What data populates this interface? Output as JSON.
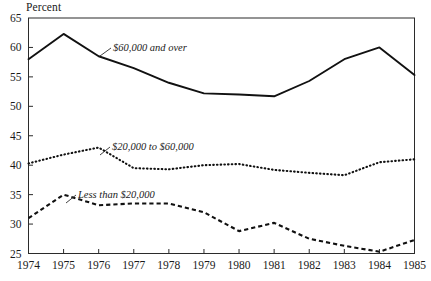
{
  "axis_unit_label": "Percent",
  "annotations": {
    "high": "$60,000 and over",
    "mid": "$20,000 to $60,000",
    "low": "Less than $20,000"
  },
  "colors": {
    "ink": "#111111",
    "frame": "#2b2b2b",
    "background": "#ffffff"
  },
  "chart_data": {
    "type": "line",
    "title": "",
    "subtitle": "",
    "xlabel": "",
    "ylabel": "Percent",
    "xlim": [
      1974,
      1985
    ],
    "ylim": [
      25,
      65
    ],
    "ytick_step": 5,
    "grid": false,
    "legend": "inline-annotations",
    "x": [
      1974,
      1975,
      1976,
      1977,
      1978,
      1979,
      1980,
      1981,
      1982,
      1983,
      1984,
      1985
    ],
    "xticklabels": [
      "1974",
      "1975",
      "1976",
      "1977",
      "1978",
      "1979",
      "1980",
      "1981",
      "1982",
      "1983",
      "1984",
      "1985"
    ],
    "yticklabels": [
      "25",
      "30",
      "35",
      "40",
      "45",
      "50",
      "55",
      "60",
      "65"
    ],
    "yticks": [
      25,
      30,
      35,
      40,
      45,
      50,
      55,
      60,
      65
    ],
    "series": [
      {
        "name": "$60,000 and over",
        "style": "solid",
        "values": [
          58.0,
          62.3,
          58.5,
          56.5,
          54.0,
          52.2,
          52.0,
          51.7,
          54.3,
          58.0,
          60.0,
          55.3
        ]
      },
      {
        "name": "$20,000 to $60,000",
        "style": "dotted",
        "values": [
          40.3,
          41.8,
          43.0,
          39.5,
          39.3,
          40.0,
          40.2,
          39.2,
          38.7,
          38.3,
          40.5,
          41.0
        ]
      },
      {
        "name": "Less than $20,000",
        "style": "dashed",
        "values": [
          31.0,
          35.0,
          33.2,
          33.5,
          33.5,
          32.0,
          28.8,
          30.2,
          27.5,
          26.3,
          25.3,
          27.3
        ]
      }
    ]
  }
}
